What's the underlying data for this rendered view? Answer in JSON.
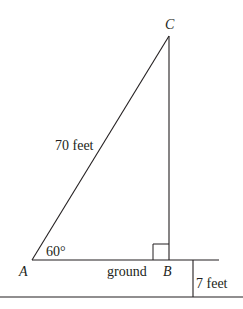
{
  "diagram": {
    "type": "right-triangle word problem",
    "points": {
      "A": {
        "label": "A",
        "x": 32,
        "y": 260
      },
      "B": {
        "label": "B",
        "x": 169,
        "y": 260
      },
      "C": {
        "label": "C",
        "x": 169,
        "y": 36
      }
    },
    "labels": {
      "vertex_a": "A",
      "vertex_b": "B",
      "vertex_c": "C",
      "hypotenuse": "70 feet",
      "angle_a": "60°",
      "ground": "ground",
      "height_offset": "7 feet"
    },
    "right_angle_at": "B",
    "colors": {
      "stroke": "#231f20",
      "background": "#ffffff"
    }
  }
}
